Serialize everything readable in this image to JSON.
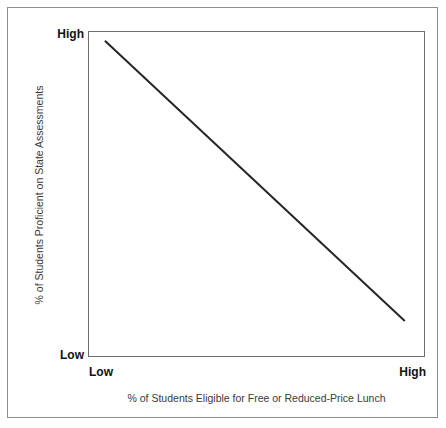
{
  "chart_data": {
    "type": "line",
    "title": "",
    "subtitle": "",
    "xlabel": "% of Students Eligible for Free or Reduced-Price Lunch",
    "ylabel": "% of Students Proficient on State Assessments",
    "x_tick_labels": [
      "Low",
      "High"
    ],
    "y_tick_labels": [
      "Low",
      "High"
    ],
    "xlim": [
      "Low",
      "High"
    ],
    "ylim": [
      "Low",
      "High"
    ],
    "grid": false,
    "legend": false,
    "legend_position": "none",
    "annotations": [],
    "series": [
      {
        "name": "trend",
        "style": "solid",
        "color": "#262626",
        "points": [
          {
            "x": 0.05,
            "y": 0.97
          },
          {
            "x": 0.94,
            "y": 0.11
          }
        ],
        "description": "Strong negative linear relationship: as the percentage of students eligible for free or reduced-price lunch increases, the percentage of students proficient on state assessments decreases."
      }
    ]
  },
  "axes": {
    "y": {
      "title": "% of Students Proficient on State Assessments",
      "high_label": "High",
      "low_label": "Low"
    },
    "x": {
      "title": "% of Students Eligible for Free or Reduced-Price Lunch",
      "high_label": "High",
      "low_label": "Low"
    }
  },
  "colors": {
    "line": "#262626",
    "plot_border": "#6d6d6d",
    "outer_border": "#8e8e8e",
    "tick_text": "#111111",
    "title_text": "#3a3a3a",
    "background": "#ffffff"
  }
}
